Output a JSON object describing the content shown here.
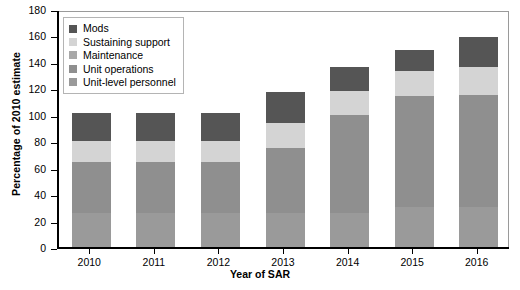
{
  "chart_data": {
    "type": "bar",
    "subtype": "stacked-bar",
    "title": "",
    "xlabel": "Year of SAR",
    "ylabel": "Percentage of 2010 estimate",
    "categories": [
      "2010",
      "2011",
      "2012",
      "2013",
      "2014",
      "2015",
      "2016"
    ],
    "ylim": [
      0,
      180
    ],
    "yticks": [
      0,
      20,
      40,
      60,
      80,
      100,
      120,
      140,
      160,
      180
    ],
    "ytick_labels": [
      "0",
      "20",
      "40",
      "60",
      "80",
      "100",
      "120",
      "140",
      "160",
      "180"
    ],
    "grid": false,
    "legend_position": "upper left",
    "stack_order_bottom_to_top": [
      "Unit-level personnel",
      "Unit operations",
      "Maintenance",
      "Sustaining support",
      "Mods"
    ],
    "series": [
      {
        "name": "Unit-level personnel",
        "color": "#9a9a9a",
        "values": [
          26,
          26,
          26,
          26,
          26,
          30,
          30
        ]
      },
      {
        "name": "Unit operations",
        "color": "#8f8f8f",
        "values": [
          38,
          38,
          38,
          49,
          74,
          84,
          85
        ]
      },
      {
        "name": "Maintenance",
        "color": "#a8a8a8",
        "values": [
          0,
          0,
          0,
          0,
          0,
          0,
          0
        ]
      },
      {
        "name": "Sustaining support",
        "color": "#d4d4d4",
        "values": [
          16,
          16,
          16,
          19,
          18,
          19,
          21
        ]
      },
      {
        "name": "Mods",
        "color": "#555555",
        "values": [
          21,
          21,
          21,
          23,
          18,
          16,
          23
        ]
      }
    ],
    "totals": [
      101,
      101,
      101,
      117,
      136,
      149,
      159
    ]
  },
  "legend": {
    "items": [
      {
        "label": "Mods",
        "color": "#555555"
      },
      {
        "label": "Sustaining support",
        "color": "#d4d4d4"
      },
      {
        "label": "Maintenance",
        "color": "#a8a8a8"
      },
      {
        "label": "Unit operations",
        "color": "#8f8f8f"
      },
      {
        "label": "Unit-level personnel",
        "color": "#9a9a9a"
      }
    ]
  }
}
